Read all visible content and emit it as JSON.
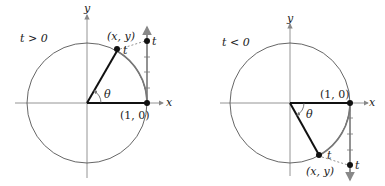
{
  "panels": [
    {
      "condition": "t > 0",
      "point_label": "(x, y)",
      "origin_point_label": "(1, 0)",
      "angle_label": "θ",
      "arc_label": "t",
      "line_label": "t",
      "x_axis_label": "x",
      "y_axis_label": "y"
    },
    {
      "condition": "t < 0",
      "point_label": "(x, y)",
      "origin_point_label": "(1, 0)",
      "angle_label": "θ",
      "arc_label": "t",
      "line_label": "t",
      "x_axis_label": "x",
      "y_axis_label": "y"
    }
  ],
  "colors": {
    "circle": "#555555",
    "axis": "#888888",
    "radius": "#111111",
    "wrap": "#777777"
  }
}
